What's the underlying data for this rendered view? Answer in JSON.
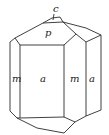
{
  "diagram": {
    "type": "crystal-drawing",
    "faces": {
      "c": "c",
      "p": "p",
      "m_left": "m",
      "a_front": "a",
      "m_right": "m",
      "a_right": "a"
    },
    "colors": {
      "line": "#2a2a2a",
      "background": "#ffffff"
    }
  }
}
